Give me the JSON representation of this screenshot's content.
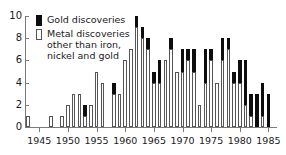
{
  "chart_data": {
    "type": "bar",
    "stacked": true,
    "title": "",
    "xlabel": "",
    "ylabel": "",
    "ylim": [
      0,
      10
    ],
    "yticks": [
      0,
      2,
      4,
      6,
      8,
      10
    ],
    "xticks": [
      1945,
      1950,
      1955,
      1960,
      1965,
      1970,
      1975,
      1980,
      1985
    ],
    "xlim": [
      1942.5,
      1986.5
    ],
    "grid": false,
    "legend_position": "top-left",
    "series": [
      {
        "name": "Metal discoveries other than iron, nickel and gold",
        "color": "#ffffff",
        "values": [
          1,
          0,
          0,
          0,
          1,
          0,
          1,
          2,
          3,
          3,
          1,
          2,
          5,
          4,
          0,
          3,
          3,
          6,
          7,
          9,
          8,
          7,
          4,
          4,
          6,
          7,
          5,
          5,
          6,
          5,
          2,
          4,
          6,
          4,
          6,
          7,
          4,
          4,
          2,
          1,
          0,
          1,
          0
        ]
      },
      {
        "name": "Gold discoveries",
        "color": "#0d0d0d",
        "values": [
          0,
          0,
          0,
          0,
          0,
          0,
          0,
          0,
          0,
          0,
          1,
          0,
          0,
          0,
          0,
          1,
          0,
          0,
          0,
          1,
          1,
          1,
          1,
          2,
          0,
          1,
          0,
          2,
          1,
          2,
          0,
          3,
          1,
          0,
          2,
          1,
          1,
          2,
          4,
          2,
          3,
          3,
          3
        ]
      }
    ],
    "categories": [
      1943,
      1944,
      1945,
      1946,
      1947,
      1948,
      1949,
      1950,
      1951,
      1952,
      1953,
      1954,
      1955,
      1956,
      1957,
      1958,
      1959,
      1960,
      1961,
      1962,
      1963,
      1964,
      1965,
      1966,
      1967,
      1968,
      1969,
      1970,
      1971,
      1972,
      1973,
      1974,
      1975,
      1976,
      1977,
      1978,
      1979,
      1980,
      1981,
      1982,
      1983,
      1984,
      1985
    ]
  },
  "legend": {
    "gold_label": "Gold discoveries",
    "metal_label": "Metal discoveries\nother than iron,\nnickel and gold"
  },
  "axis": {
    "y_labels": [
      "10",
      "8",
      "6",
      "4",
      "2",
      "0"
    ],
    "x_labels": [
      "1945",
      "1950",
      "1955",
      "1960",
      "1965",
      "1970",
      "1975",
      "1980",
      "1985"
    ]
  }
}
